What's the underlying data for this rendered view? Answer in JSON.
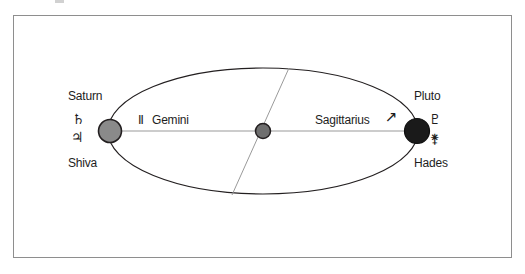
{
  "figure": {
    "title_text": "",
    "border_color": "#8e8e8e",
    "background": "#ffffff"
  },
  "orbit": {
    "shape": "ellipse",
    "stroke_color": "#231f20",
    "axis_line_color": "#9a9a9a",
    "node_line_color": "#9a9a9a"
  },
  "bodies": {
    "left": {
      "name_label": "Saturn",
      "alt_name_label": "Shiva",
      "symbol_glyph": "♄",
      "symbol_name": "saturn-symbol",
      "alt_symbol_glyph": "♃",
      "alt_symbol_name": "shiva-trident-symbol",
      "fill_color": "#8a8a8a",
      "stroke_color": "#231f20"
    },
    "center": {
      "name_label": "",
      "fill_color": "#6f6f6f",
      "stroke_color": "#231f20"
    },
    "right": {
      "name_label": "Pluto",
      "alt_name_label": "Hades",
      "symbol_glyph": "♇",
      "symbol_name": "pluto-symbol",
      "alt_symbol_glyph": "⚵",
      "alt_symbol_name": "hades-symbol",
      "fill_color": "#1a1a1a",
      "stroke_color": "#0d0d0d"
    }
  },
  "zodiac": {
    "left_sign": {
      "label": "Gemini",
      "symbol_glyph": "Ⅱ",
      "symbol_name": "gemini-symbol"
    },
    "right_sign": {
      "label": "Sagittarius",
      "symbol_glyph": "↗",
      "symbol_name": "sagittarius-symbol"
    }
  }
}
